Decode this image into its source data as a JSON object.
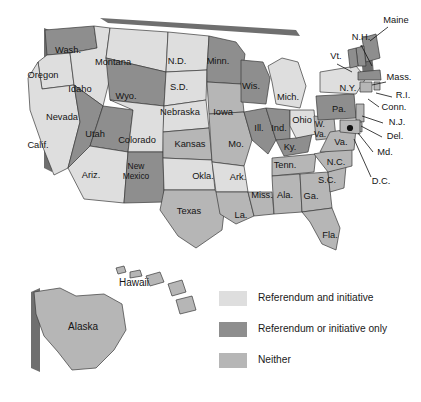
{
  "map": {
    "title": "United States referendum and initiative map",
    "colors": {
      "both": "#dedede",
      "only": "#8e8e8e",
      "neither": "#b6b6b6",
      "border": "#3a3a3a",
      "shadow": "#6f6f6f",
      "background": "#ffffff",
      "label": "#141414"
    },
    "states": [
      {
        "abbr": "WA",
        "label": "Wash.",
        "category": "only",
        "x": 68,
        "y": 51
      },
      {
        "abbr": "OR",
        "label": "Oregon",
        "category": "both",
        "x": 43,
        "y": 76
      },
      {
        "abbr": "CA",
        "label": "Calif.",
        "category": "both",
        "x": 38,
        "y": 146
      },
      {
        "abbr": "ID",
        "label": "Idaho",
        "category": "both",
        "x": 80,
        "y": 90
      },
      {
        "abbr": "NV",
        "label": "Nevada",
        "category": "only",
        "x": 62,
        "y": 118
      },
      {
        "abbr": "UT",
        "label": "Utah",
        "category": "only",
        "x": 95,
        "y": 135
      },
      {
        "abbr": "AZ",
        "label": "Ariz.",
        "category": "both",
        "x": 91,
        "y": 176
      },
      {
        "abbr": "MT",
        "label": "Montana",
        "category": "both",
        "x": 113,
        "y": 63
      },
      {
        "abbr": "WY",
        "label": "Wyo.",
        "category": "only",
        "x": 126,
        "y": 97
      },
      {
        "abbr": "CO",
        "label": "Colorado",
        "category": "both",
        "x": 137,
        "y": 141
      },
      {
        "abbr": "NM",
        "label": "New",
        "label2": "Mexico",
        "category": "only",
        "x": 136,
        "y": 172
      },
      {
        "abbr": "ND",
        "label": "N.D.",
        "category": "both",
        "x": 177,
        "y": 62
      },
      {
        "abbr": "SD",
        "label": "S.D.",
        "category": "both",
        "x": 179,
        "y": 88
      },
      {
        "abbr": "NE",
        "label": "Nebraska",
        "category": "both",
        "x": 180,
        "y": 113
      },
      {
        "abbr": "KS",
        "label": "Kansas",
        "category": "neither",
        "x": 190,
        "y": 145
      },
      {
        "abbr": "OK",
        "label": "Okla.",
        "category": "both",
        "x": 203,
        "y": 177
      },
      {
        "abbr": "TX",
        "label": "Texas",
        "category": "neither",
        "x": 189,
        "y": 212
      },
      {
        "abbr": "MN",
        "label": "Minn.",
        "category": "only",
        "x": 218,
        "y": 62
      },
      {
        "abbr": "IA",
        "label": "Iowa",
        "category": "neither",
        "x": 223,
        "y": 113
      },
      {
        "abbr": "MO",
        "label": "Mo.",
        "category": "neither",
        "x": 236,
        "y": 145
      },
      {
        "abbr": "AR",
        "label": "Ark.",
        "category": "both",
        "x": 238,
        "y": 178
      },
      {
        "abbr": "LA",
        "label": "La.",
        "category": "neither",
        "x": 241,
        "y": 216
      },
      {
        "abbr": "WI",
        "label": "Wis.",
        "category": "only",
        "x": 251,
        "y": 87
      },
      {
        "abbr": "IL",
        "label": "Ill.",
        "category": "only",
        "x": 259,
        "y": 129
      },
      {
        "abbr": "MS",
        "label": "Miss.",
        "category": "neither",
        "x": 262,
        "y": 196
      },
      {
        "abbr": "MI",
        "label": "Mich.",
        "category": "both",
        "x": 288,
        "y": 98
      },
      {
        "abbr": "IN",
        "label": "Ind.",
        "category": "only",
        "x": 279,
        "y": 129
      },
      {
        "abbr": "KY",
        "label": "Ky.",
        "category": "only",
        "x": 290,
        "y": 148
      },
      {
        "abbr": "TN",
        "label": "Tenn.",
        "category": "neither",
        "x": 285,
        "y": 166
      },
      {
        "abbr": "AL",
        "label": "Ala.",
        "category": "neither",
        "x": 285,
        "y": 196
      },
      {
        "abbr": "OH",
        "label": "Ohio",
        "category": "both",
        "x": 302,
        "y": 121
      },
      {
        "abbr": "GA",
        "label": "Ga.",
        "category": "neither",
        "x": 311,
        "y": 197
      },
      {
        "abbr": "FL",
        "label": "Fla.",
        "category": "neither",
        "x": 330,
        "y": 236
      },
      {
        "abbr": "SC",
        "label": "S.C.",
        "category": "neither",
        "x": 327,
        "y": 181
      },
      {
        "abbr": "NC",
        "label": "N.C.",
        "category": "neither",
        "x": 336,
        "y": 163
      },
      {
        "abbr": "WV",
        "label": "W.",
        "label2": "Va.",
        "category": "neither",
        "x": 320,
        "y": 130
      },
      {
        "abbr": "VA",
        "label": "Va.",
        "category": "neither",
        "x": 341,
        "y": 143
      },
      {
        "abbr": "PA",
        "label": "Pa.",
        "category": "only",
        "x": 339,
        "y": 110
      },
      {
        "abbr": "NY",
        "label": "N.Y.",
        "category": "both",
        "x": 348,
        "y": 89
      },
      {
        "abbr": "AK",
        "label": "Alaska",
        "category": "neither",
        "x": 83,
        "y": 327
      },
      {
        "abbr": "HI",
        "label": "Hawaii",
        "category": "neither",
        "x": 134,
        "y": 283
      }
    ],
    "callouts": [
      {
        "abbr": "ME",
        "label": "Maine",
        "category": "only",
        "x": 396,
        "y": 21,
        "anchor": "middle"
      },
      {
        "abbr": "NH",
        "label": "N.H.",
        "category": "only",
        "x": 361,
        "y": 38,
        "anchor": "middle"
      },
      {
        "abbr": "VT",
        "label": "Vt.",
        "category": "only",
        "x": 336,
        "y": 57,
        "anchor": "middle"
      },
      {
        "abbr": "MA",
        "label": "Mass.",
        "category": "only",
        "x": 399,
        "y": 78,
        "anchor": "middle"
      },
      {
        "abbr": "RI",
        "label": "R.I.",
        "category": "neither",
        "x": 403,
        "y": 96,
        "anchor": "middle"
      },
      {
        "abbr": "CT",
        "label": "Conn.",
        "category": "neither",
        "x": 394,
        "y": 108,
        "anchor": "middle"
      },
      {
        "abbr": "NJ",
        "label": "N.J.",
        "category": "neither",
        "x": 397,
        "y": 123,
        "anchor": "middle"
      },
      {
        "abbr": "DE",
        "label": "Del.",
        "category": "neither",
        "x": 395,
        "y": 137,
        "anchor": "middle"
      },
      {
        "abbr": "MD",
        "label": "Md.",
        "category": "neither",
        "x": 385,
        "y": 153,
        "anchor": "middle"
      },
      {
        "abbr": "DC",
        "label": "D.C.",
        "category": "neither",
        "x": 381,
        "y": 182,
        "anchor": "middle"
      }
    ]
  },
  "legend": {
    "items": [
      {
        "label": "Referendum and initiative",
        "key": "both",
        "color": "#dedede"
      },
      {
        "label": "Referendum or initiative only",
        "key": "only",
        "color": "#8e8e8e"
      },
      {
        "label": "Neither",
        "key": "neither",
        "color": "#b6b6b6"
      }
    ]
  }
}
